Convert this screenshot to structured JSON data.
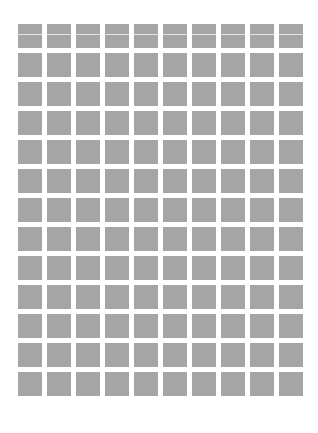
{
  "grid": {
    "rows": 13,
    "columns": 10,
    "cell_color": "#a5a5a5",
    "background": "#ffffff",
    "first_row_has_line": true,
    "line_color": "#e4e4e4"
  }
}
